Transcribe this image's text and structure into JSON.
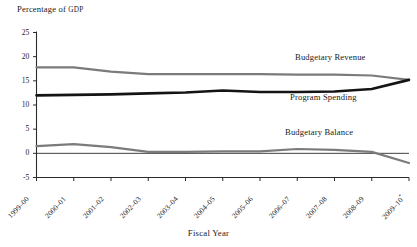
{
  "chart_data": {
    "type": "line",
    "title": "",
    "ylabel": "Percentage of GDP",
    "xlabel": "Fiscal Year",
    "ylim": [
      -5,
      25
    ],
    "yticks": [
      25,
      20,
      15,
      10,
      5,
      0,
      -5
    ],
    "grid": false,
    "legend_position": "inline-annotations",
    "zero_line": true,
    "categories": [
      "1999–00",
      "2000–01",
      "2001–02",
      "2002–03",
      "2003–04",
      "2004–05",
      "2005–06",
      "2006–07",
      "2007–08",
      "2008–09",
      "2009–10"
    ],
    "last_category_footnote": "*",
    "series": [
      {
        "name": "Budgetary Revenue",
        "color": "#7b7b7b",
        "values": [
          17.8,
          17.8,
          16.9,
          16.4,
          16.4,
          16.4,
          16.4,
          16.3,
          16.3,
          16.1,
          15.2
        ]
      },
      {
        "name": "Program Spending",
        "color": "#141414",
        "values": [
          12.0,
          12.1,
          12.2,
          12.4,
          12.6,
          13.0,
          12.7,
          12.7,
          12.8,
          13.3,
          15.2
        ]
      },
      {
        "name": "Budgetary Balance",
        "color": "#7b7b7b",
        "values": [
          1.5,
          1.9,
          1.3,
          0.3,
          0.3,
          0.4,
          0.4,
          0.9,
          0.7,
          0.3,
          -2.0
        ]
      }
    ]
  },
  "annotations": {
    "revenue_label": "Budgetary Revenue",
    "spending_label": "Program Spending",
    "balance_label": "Budgetary Balance"
  },
  "axes": {
    "y_title_main": "Percentage of ",
    "y_title_caps": "GDP",
    "x_title": "Fiscal Year"
  }
}
